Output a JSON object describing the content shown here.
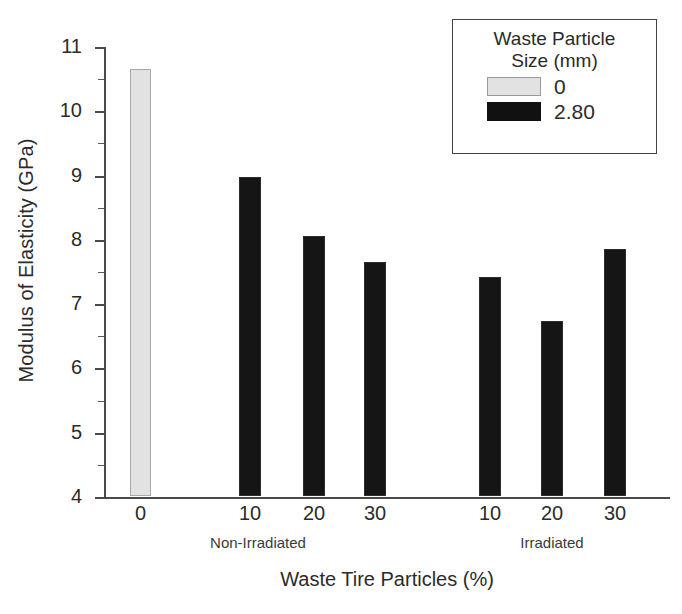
{
  "chart_data": {
    "type": "bar",
    "title": "",
    "xlabel": "Waste Tire Particles (%)",
    "ylabel": "Modulus of Elasticity (GPa)",
    "ylim": [
      4,
      11
    ],
    "y_major_ticks": [
      4,
      5,
      6,
      7,
      8,
      9,
      10,
      11
    ],
    "y_minor_ticks": [
      4.5,
      5.5,
      6.5,
      7.5,
      8.5,
      9.5,
      10.5
    ],
    "grid": false,
    "legend": {
      "title_line1": "Waste Particle",
      "title_line2": "Size (mm)",
      "position": "top-right",
      "entries": [
        {
          "label": "0",
          "color": "#e2e2e2",
          "swatch": "light"
        },
        {
          "label": "2.80",
          "color": "#111111",
          "swatch": "dark"
        }
      ]
    },
    "groups": [
      {
        "label": "Non-Irradiated",
        "center_px": 258
      },
      {
        "label": "Irradiated",
        "center_px": 552
      }
    ],
    "categories": [
      "0",
      "10",
      "20",
      "30",
      "10",
      "20",
      "30"
    ],
    "series": [
      {
        "name": "0",
        "color": "#e2e2e2",
        "values": [
          10.65,
          null,
          null,
          null,
          null,
          null,
          null
        ]
      },
      {
        "name": "2.80",
        "color": "#111111",
        "values": [
          null,
          8.96,
          8.05,
          7.64,
          7.41,
          6.72,
          7.84
        ]
      }
    ],
    "bars": [
      {
        "category": "0",
        "group": "Non-Irradiated",
        "value": 10.65,
        "series": "0",
        "swatch": "light",
        "x_px": 130,
        "w_px": 21
      },
      {
        "category": "10",
        "group": "Non-Irradiated",
        "value": 8.96,
        "series": "2.80",
        "swatch": "dark",
        "x_px": 239,
        "w_px": 22
      },
      {
        "category": "20",
        "group": "Non-Irradiated",
        "value": 8.05,
        "series": "2.80",
        "swatch": "dark",
        "x_px": 303,
        "w_px": 22
      },
      {
        "category": "30",
        "group": "Non-Irradiated",
        "value": 7.64,
        "series": "2.80",
        "swatch": "dark",
        "x_px": 364,
        "w_px": 22
      },
      {
        "category": "10",
        "group": "Irradiated",
        "value": 7.41,
        "series": "2.80",
        "swatch": "dark",
        "x_px": 479,
        "w_px": 22
      },
      {
        "category": "20",
        "group": "Irradiated",
        "value": 6.72,
        "series": "2.80",
        "swatch": "dark",
        "x_px": 541,
        "w_px": 22
      },
      {
        "category": "30",
        "group": "Irradiated",
        "value": 7.84,
        "series": "2.80",
        "swatch": "dark",
        "x_px": 604,
        "w_px": 22
      }
    ]
  }
}
